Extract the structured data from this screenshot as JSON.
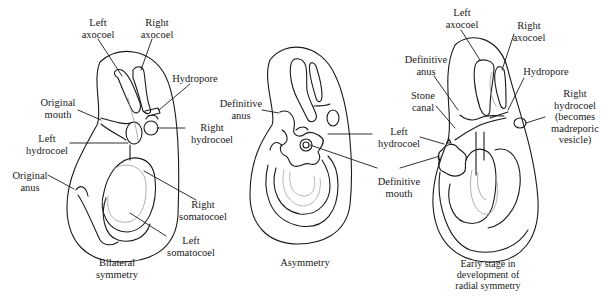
{
  "figure": {
    "panels": [
      {
        "id": "bilateral",
        "caption": "Bilateral\nsymmetry",
        "labels": {
          "left_axocoel": "Left\naxocoel",
          "right_axocoel": "Right\naxocoel",
          "hydropore": "Hydropore",
          "original_mouth": "Original\nmouth",
          "right_hydrocoel": "Right\nhydrocoel",
          "left_hydrocoel": "Left\nhydrocoel",
          "original_anus": "Original\nanus",
          "right_somatocoel": "Right\nsomatocoel",
          "left_somatocoel": "Left\nsomatocoel"
        }
      },
      {
        "id": "asymmetry",
        "caption": "Asymmetry",
        "labels": {
          "definitive_anus": "Definitive\nanus",
          "left_hydrocoel": "Left\nhydrocoel",
          "definitive_mouth": "Definitive\nmouth"
        }
      },
      {
        "id": "radial",
        "caption": "Early stage in\ndevelopment of\nradial symmetry",
        "labels": {
          "left_axocoel": "Left\naxocoel",
          "right_axocoel": "Right\naxocoel",
          "definitive_anus": "Definitive\nanus",
          "hydropore": "Hydropore",
          "stone_canal": "Stone\ncanal",
          "right_hydrocoel": "Right\nhydrocoel\n(becomes\nmadreporic\nvesicle)",
          "left_hydrocoel": "Left\nhydrocoel"
        }
      }
    ],
    "colors": {
      "line": "#1a1a1a",
      "faint_line": "#9a9a9a"
    }
  }
}
